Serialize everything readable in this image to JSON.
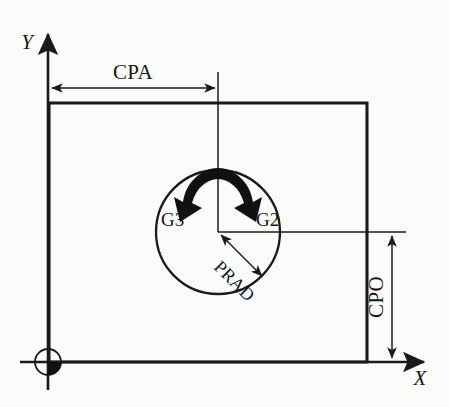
{
  "diagram": {
    "background_color": "#fbfbf9",
    "line_color": "#1a1a1a",
    "axes": {
      "y_label": "Y",
      "x_label": "X",
      "origin_name": "workpiece-zero"
    },
    "dimensions": [
      {
        "key": "cpa",
        "label": "CPA",
        "meaning": "circle position along X",
        "orientation": "horizontal"
      },
      {
        "key": "cpo",
        "label": "CPO",
        "meaning": "circle position along Y",
        "orientation": "vertical"
      },
      {
        "key": "prad",
        "label": "PRAD",
        "meaning": "programmed radius",
        "orientation": "diagonal"
      }
    ],
    "arc_directions": [
      {
        "key": "g3",
        "label": "G3",
        "meaning": "counterclockwise",
        "side": "left"
      },
      {
        "key": "g2",
        "label": "G2",
        "meaning": "clockwise",
        "side": "right"
      }
    ]
  }
}
